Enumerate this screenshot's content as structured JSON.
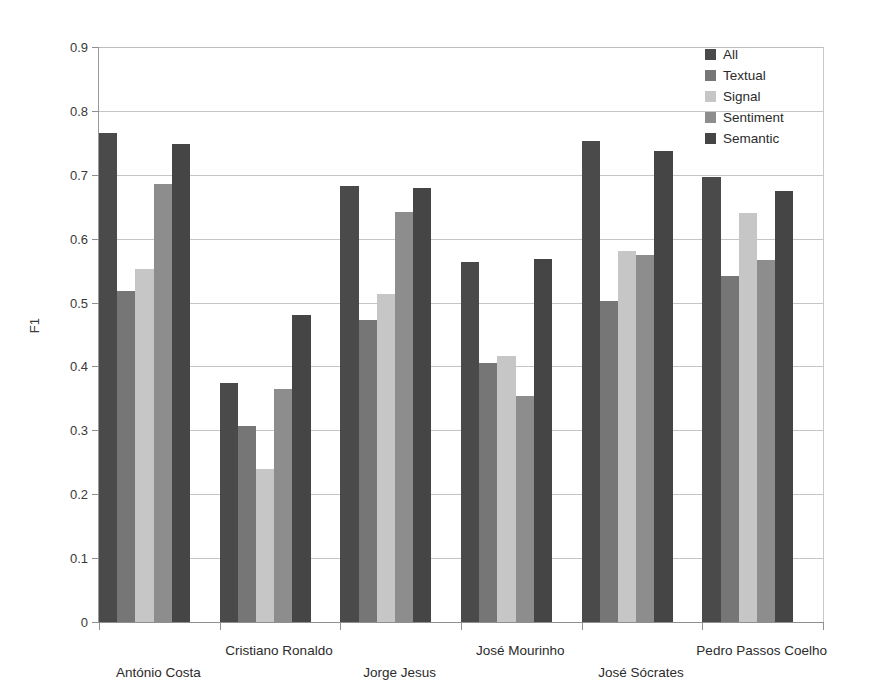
{
  "chart_data": {
    "type": "bar",
    "title": "",
    "xlabel": "",
    "ylabel": "F1",
    "ylim": [
      0,
      0.9
    ],
    "grid": true,
    "legend_position": "top-right",
    "categories": [
      "António Costa",
      "Cristiano Ronaldo",
      "Jorge Jesus",
      "José Mourinho",
      "José Sócrates",
      "Pedro Passos Coelho"
    ],
    "ytick_labels": [
      "0.9",
      "0.8",
      "0.7",
      "0.6",
      "0.5",
      "0.4",
      "0.3",
      "0.2",
      "0.1",
      "0"
    ],
    "ytick_values": [
      0.9,
      0.8,
      0.7,
      0.6,
      0.5,
      0.4,
      0.3,
      0.2,
      0.1,
      0
    ],
    "series": [
      {
        "name": "All",
        "color": "#4a4a4a",
        "values": [
          0.765,
          0.374,
          0.683,
          0.563,
          0.753,
          0.697
        ]
      },
      {
        "name": "Textual",
        "color": "#767676",
        "values": [
          0.518,
          0.307,
          0.472,
          0.405,
          0.502,
          0.541
        ]
      },
      {
        "name": "Signal",
        "color": "#c6c6c6",
        "values": [
          0.552,
          0.24,
          0.513,
          0.416,
          0.581,
          0.64
        ]
      },
      {
        "name": "Sentiment",
        "color": "#8d8d8d",
        "values": [
          0.685,
          0.365,
          0.641,
          0.354,
          0.574,
          0.567
        ]
      },
      {
        "name": "Semantic",
        "color": "#454545",
        "values": [
          0.748,
          0.481,
          0.68,
          0.568,
          0.738,
          0.675
        ]
      }
    ]
  }
}
